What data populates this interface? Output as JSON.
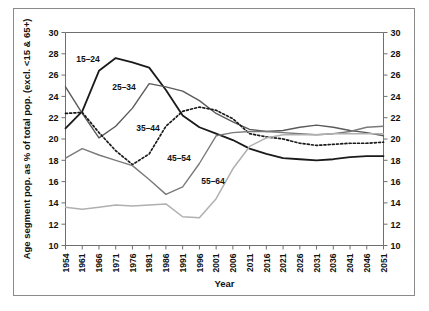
{
  "chart_data": {
    "type": "line",
    "title": "",
    "xlabel": "Year",
    "ylabel": "Age segment pop. as % of total pop. (excl. <15 & 65+)",
    "ylabel_right": "Age segment pop. as % of total pop. (excl. <15 & 65+)",
    "ylim": [
      10,
      30
    ],
    "ytick_step": 2,
    "yticks": [
      10,
      12,
      14,
      16,
      18,
      20,
      22,
      24,
      26,
      28,
      30
    ],
    "yticks_right": [
      10,
      12,
      14,
      16,
      18,
      20,
      22,
      24,
      26,
      28,
      30
    ],
    "grid": false,
    "legend_position": "inline-annotations",
    "dual_axis": true,
    "x": [
      1954,
      1961,
      1966,
      1971,
      1976,
      1981,
      1986,
      1991,
      1996,
      2001,
      2006,
      2011,
      2016,
      2021,
      2026,
      2031,
      2036,
      2041,
      2046,
      2051
    ],
    "xtick_labels": [
      "1954",
      "1961",
      "1966",
      "1971",
      "1976",
      "1981",
      "1986",
      "1991",
      "1996",
      "2001",
      "2006",
      "2011",
      "2016",
      "2021",
      "2026",
      "2031",
      "2036",
      "2041",
      "2046",
      "2051"
    ],
    "series": [
      {
        "name": "15-24",
        "label": "15–24",
        "color": "#1a1a1a",
        "width": 1.8,
        "dash": "none",
        "values": [
          21.0,
          22.6,
          26.4,
          27.6,
          27.2,
          26.7,
          24.6,
          22.2,
          21.1,
          20.5,
          19.9,
          19.1,
          18.6,
          18.2,
          18.1,
          18.0,
          18.1,
          18.3,
          18.4,
          18.4
        ]
      },
      {
        "name": "25-34",
        "label": "25–34",
        "color": "#5a5a5a",
        "width": 1.4,
        "dash": "none",
        "values": [
          24.9,
          22.4,
          20.1,
          21.2,
          22.9,
          25.2,
          24.9,
          24.5,
          23.6,
          22.4,
          21.6,
          20.9,
          20.7,
          20.8,
          21.1,
          21.3,
          21.1,
          20.8,
          20.6,
          20.3
        ]
      },
      {
        "name": "35-44",
        "label": "35–44",
        "color": "#1a1a1a",
        "width": 1.7,
        "dash": "2,2.2",
        "values": [
          22.4,
          22.5,
          20.6,
          18.9,
          17.6,
          18.6,
          21.2,
          22.6,
          23.0,
          22.7,
          21.9,
          20.5,
          20.2,
          20.0,
          19.6,
          19.4,
          19.5,
          19.6,
          19.6,
          19.7
        ]
      },
      {
        "name": "45-54",
        "label": "45–54",
        "color": "#7a7a7a",
        "width": 1.4,
        "dash": "none",
        "values": [
          18.2,
          19.1,
          18.5,
          18.0,
          17.5,
          16.2,
          14.8,
          15.5,
          17.7,
          20.3,
          20.6,
          20.7,
          20.7,
          20.6,
          20.5,
          20.4,
          20.5,
          20.7,
          21.1,
          21.2
        ]
      },
      {
        "name": "55-64",
        "label": "55–64",
        "color": "#b0b0b0",
        "width": 1.5,
        "dash": "none",
        "values": [
          13.6,
          13.4,
          13.6,
          13.8,
          13.7,
          13.8,
          13.9,
          12.7,
          12.6,
          14.4,
          17.2,
          19.3,
          20.1,
          20.4,
          20.4,
          20.4,
          20.5,
          20.5,
          20.5,
          20.5
        ]
      }
    ],
    "annotations": [
      {
        "text": "15–24",
        "x_px": 88,
        "y_px": 62
      },
      {
        "text": "25–34",
        "x_px": 124,
        "y_px": 90
      },
      {
        "text": "35–44",
        "x_px": 148,
        "y_px": 131
      },
      {
        "text": "45–54",
        "x_px": 179,
        "y_px": 161
      },
      {
        "text": "55–64",
        "x_px": 213,
        "y_px": 184
      }
    ]
  },
  "axes": {
    "x_title": "Year",
    "y_title": "Age segment pop. as % of total pop. (excl. <15 & 65+)"
  }
}
